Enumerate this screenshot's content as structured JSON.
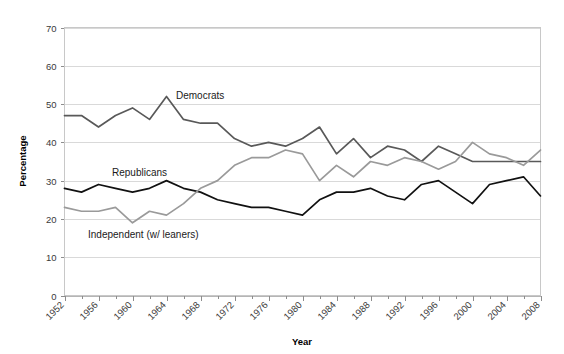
{
  "chart_data": {
    "type": "line",
    "title": "",
    "xlabel": "Year",
    "ylabel": "Percentage",
    "ylim": [
      0,
      70
    ],
    "ytick_values": [
      0,
      10,
      20,
      30,
      40,
      50,
      60,
      70
    ],
    "ytick_labels": [
      "0",
      "10",
      "20",
      "30",
      "40",
      "50",
      "60",
      "70"
    ],
    "xlim": [
      1952,
      2008
    ],
    "xtick_labels": [
      "1952",
      "1956",
      "1960",
      "1964",
      "1968",
      "1972",
      "1976",
      "1980",
      "1984",
      "1988",
      "1992",
      "1996",
      "2000",
      "2004",
      "2008"
    ],
    "xtick_values": [
      1952,
      1956,
      1960,
      1964,
      1968,
      1972,
      1976,
      1980,
      1984,
      1988,
      1992,
      1996,
      2000,
      2004,
      2008
    ],
    "grid": true,
    "grid_axis": "y",
    "legend_position": "inline-annotations",
    "x": [
      1952,
      1954,
      1956,
      1958,
      1960,
      1962,
      1964,
      1966,
      1968,
      1970,
      1972,
      1974,
      1976,
      1978,
      1980,
      1982,
      1984,
      1986,
      1988,
      1990,
      1992,
      1994,
      1996,
      1998,
      2000,
      2002,
      2004,
      2006,
      2008
    ],
    "series": [
      {
        "name": "Democrats",
        "color": "#595959",
        "values": [
          47,
          47,
          44,
          47,
          49,
          46,
          52,
          46,
          45,
          45,
          41,
          39,
          40,
          39,
          41,
          44,
          37,
          41,
          36,
          39,
          38,
          35,
          39,
          37,
          35,
          35,
          35,
          35,
          35
        ]
      },
      {
        "name": "Republicans",
        "color": "#111111",
        "values": [
          28,
          27,
          29,
          28,
          27,
          28,
          30,
          28,
          27,
          25,
          24,
          23,
          23,
          22,
          21,
          25,
          27,
          27,
          28,
          26,
          25,
          29,
          30,
          27,
          24,
          29,
          30,
          31,
          26
        ]
      },
      {
        "name": "Independent (w/ leaners)",
        "color": "#9a9a9a",
        "values": [
          23,
          22,
          22,
          23,
          19,
          22,
          21,
          24,
          28,
          30,
          34,
          36,
          36,
          38,
          37,
          30,
          34,
          31,
          35,
          34,
          36,
          35,
          33,
          35,
          40,
          37,
          36,
          34,
          38
        ]
      }
    ],
    "annotations": [
      {
        "name": "democrats-label",
        "text": "Democrats",
        "x": 1964,
        "y": 52
      },
      {
        "name": "republicans-label",
        "text": "Republicans",
        "x": 1962,
        "y": 30
      },
      {
        "name": "independent-label",
        "text": "Independent (w/ leaners)",
        "x": 1964,
        "y": 19
      }
    ]
  }
}
